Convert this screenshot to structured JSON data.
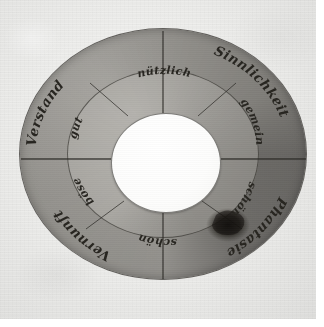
{
  "artifact": {
    "kind": "hand-drawn paper volvelle (rotating disc diagram)",
    "title": "Handgezeichnete Scheibe",
    "medium": "ink on paper, photographed",
    "shape": "annulus-with-central-hole"
  },
  "colors": {
    "paper_background": "#efefed",
    "outer_ring_fill": "#a3a19c",
    "inner_ring_fill": "#b4b2ad",
    "center_hole": "#fdfdfc",
    "ink": "#272520",
    "line": "#2a2824",
    "blot": "#14120f",
    "page_margin": "#ffffff"
  },
  "outer_ring": {
    "label": "Aussenring",
    "segments": [
      {
        "id": "outer-upper-left",
        "text": "Verstand",
        "quadrant": "upper-left",
        "tone": "light"
      },
      {
        "id": "outer-upper-right",
        "text": "Sinnlichkeit",
        "quadrant": "upper-right",
        "tone": "dark"
      },
      {
        "id": "outer-lower-right",
        "text": "Phantasie",
        "quadrant": "lower-right",
        "tone": "darkest"
      },
      {
        "id": "outer-lower-left",
        "text": "Vernunft",
        "quadrant": "lower-left",
        "tone": "medium"
      }
    ]
  },
  "inner_ring": {
    "label": "Innenring",
    "segments": [
      {
        "id": "inner-top",
        "text": "nützlich",
        "position": "top",
        "tone": "light"
      },
      {
        "id": "inner-upper-right",
        "text": "gemein",
        "position": "upper-right",
        "tone": "dark"
      },
      {
        "id": "inner-lower-right",
        "text": "schön",
        "position": "lower-right",
        "tone": "dark"
      },
      {
        "id": "inner-bottom",
        "text": "schön",
        "position": "bottom",
        "tone": "medium"
      },
      {
        "id": "inner-lower-left",
        "text": "böse",
        "position": "lower-left",
        "tone": "medium"
      },
      {
        "id": "inner-upper-left",
        "text": "gut",
        "position": "upper-left",
        "tone": "light"
      }
    ]
  },
  "marks": {
    "ink_blot": "dark ink stain in lower-right quadrant",
    "divider_vertical": "vertical rule through the disc centre",
    "divider_horizontal": "horizontal rule through the disc centre"
  }
}
